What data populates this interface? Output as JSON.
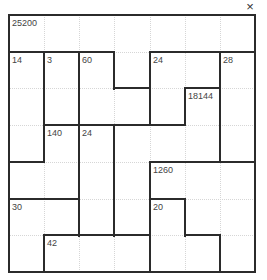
{
  "window": {
    "close_label": "×"
  },
  "puzzle": {
    "size": 7,
    "cages": [
      {
        "clue": "25200",
        "cells": [
          [
            0,
            0
          ],
          [
            0,
            1
          ],
          [
            0,
            2
          ],
          [
            0,
            3
          ],
          [
            0,
            4
          ],
          [
            0,
            5
          ],
          [
            0,
            6
          ],
          [
            1,
            3
          ]
        ]
      },
      {
        "clue": "14",
        "cells": [
          [
            1,
            0
          ],
          [
            2,
            0
          ],
          [
            3,
            0
          ]
        ]
      },
      {
        "clue": "3",
        "cells": [
          [
            1,
            1
          ],
          [
            2,
            1
          ]
        ]
      },
      {
        "clue": "60",
        "cells": [
          [
            1,
            2
          ],
          [
            2,
            2
          ],
          [
            2,
            3
          ]
        ]
      },
      {
        "clue": "24",
        "cells": [
          [
            1,
            4
          ],
          [
            1,
            5
          ],
          [
            2,
            4
          ]
        ]
      },
      {
        "clue": "28",
        "cells": [
          [
            1,
            6
          ],
          [
            2,
            6
          ],
          [
            3,
            6
          ]
        ]
      },
      {
        "clue": "18144",
        "cells": [
          [
            2,
            5
          ],
          [
            3,
            3
          ],
          [
            3,
            4
          ],
          [
            3,
            5
          ],
          [
            4,
            3
          ],
          [
            5,
            3
          ]
        ]
      },
      {
        "clue": "140",
        "cells": [
          [
            3,
            1
          ],
          [
            4,
            0
          ],
          [
            4,
            1
          ]
        ]
      },
      {
        "clue": "24",
        "cells": [
          [
            3,
            2
          ],
          [
            4,
            2
          ],
          [
            5,
            2
          ]
        ]
      },
      {
        "clue": "1260",
        "cells": [
          [
            4,
            4
          ],
          [
            4,
            5
          ],
          [
            4,
            6
          ],
          [
            5,
            5
          ],
          [
            5,
            6
          ],
          [
            6,
            6
          ]
        ]
      },
      {
        "clue": "30",
        "cells": [
          [
            5,
            0
          ],
          [
            5,
            1
          ],
          [
            6,
            0
          ]
        ]
      },
      {
        "clue": "20",
        "cells": [
          [
            5,
            4
          ],
          [
            6,
            4
          ],
          [
            6,
            5
          ]
        ]
      },
      {
        "clue": "42",
        "cells": [
          [
            6,
            1
          ],
          [
            6,
            2
          ],
          [
            6,
            3
          ]
        ]
      }
    ]
  }
}
